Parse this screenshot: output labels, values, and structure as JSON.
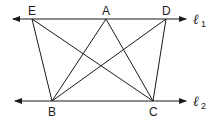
{
  "diagram": {
    "lines": [
      {
        "name": "l1",
        "label": "ℓ",
        "subscript": "1"
      },
      {
        "name": "l2",
        "label": "ℓ",
        "subscript": "2"
      }
    ],
    "points": {
      "E": "E",
      "A": "A",
      "D": "D",
      "B": "B",
      "C": "C"
    },
    "segments": [
      "EB",
      "EC",
      "AB",
      "AC",
      "DB",
      "DC"
    ],
    "colors": {
      "stroke": "#1a1a1a",
      "background": "#ffffff"
    }
  }
}
